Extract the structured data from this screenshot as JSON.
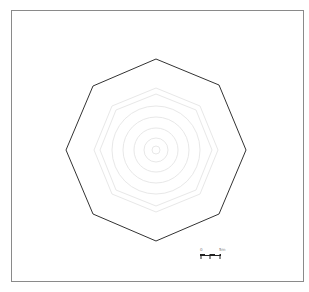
{
  "diagram": {
    "type": "concentric octagon plan",
    "center": [
      156,
      150
    ],
    "outer_octagon": {
      "points": [
        [
          156,
          59
        ],
        [
          219,
          85
        ],
        [
          246,
          150
        ],
        [
          219,
          214
        ],
        [
          156,
          241
        ],
        [
          93,
          214
        ],
        [
          66,
          150
        ],
        [
          93,
          86
        ]
      ],
      "stroke": "#333333"
    },
    "inner_rings": {
      "octagon_radii": [
        62,
        58
      ],
      "circle_radii": [
        44,
        33,
        22,
        12,
        4
      ],
      "stroke": "#e6e6e6"
    },
    "scale_bar": {
      "label_start": "0",
      "label_end": "5m",
      "segments": 4
    }
  }
}
